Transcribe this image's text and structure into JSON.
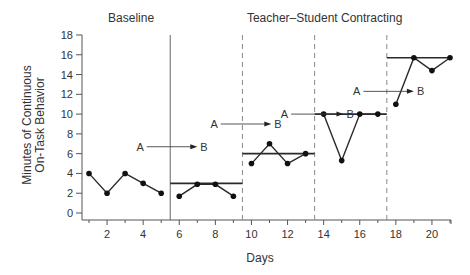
{
  "chart_data": {
    "type": "line",
    "title": "",
    "phase_titles": [
      {
        "label": "Baseline",
        "x_center_day": 3
      },
      {
        "label": "Teacher–Student Contracting",
        "x_center_day": 13.5
      }
    ],
    "xlabel": "Days",
    "ylabel_line1": "Minutes of Continuous",
    "ylabel_line2": "On-Task Behavior",
    "ylim": [
      0,
      18
    ],
    "xlim": [
      0.5,
      21.2
    ],
    "y_ticks": [
      0,
      2,
      4,
      6,
      8,
      10,
      12,
      14,
      16,
      18
    ],
    "x_ticks_labeled": [
      2,
      4,
      6,
      8,
      10,
      12,
      14,
      16,
      18,
      20
    ],
    "x_ticks_minor": [
      1,
      3,
      5,
      7,
      9,
      11,
      13,
      15,
      17,
      19,
      21
    ],
    "grid": false,
    "phase_change_lines": [
      {
        "day": 5.5,
        "style": "solid"
      },
      {
        "day": 9.5,
        "style": "dashed"
      },
      {
        "day": 13.5,
        "style": "dashed"
      },
      {
        "day": 17.5,
        "style": "dashed"
      }
    ],
    "series": [
      {
        "name": "Baseline",
        "x": [
          1,
          2,
          3,
          4,
          5
        ],
        "values": [
          4,
          2,
          4,
          3,
          2
        ]
      },
      {
        "name": "Contract Phase 1",
        "x": [
          6,
          7,
          8,
          9
        ],
        "values": [
          1.7,
          2.9,
          2.9,
          1.7
        ]
      },
      {
        "name": "Contract Phase 2",
        "x": [
          10,
          11,
          12,
          13
        ],
        "values": [
          5,
          7,
          5,
          6
        ]
      },
      {
        "name": "Contract Phase 3",
        "x": [
          14,
          15,
          16,
          17
        ],
        "values": [
          10,
          5.3,
          10,
          10
        ]
      },
      {
        "name": "Contract Phase 4",
        "x": [
          18,
          19,
          20,
          21
        ],
        "values": [
          11,
          15.7,
          14.4,
          15.7
        ]
      }
    ],
    "criterion_lines": [
      {
        "from_day": 5.5,
        "to_day": 9.5,
        "value": 3
      },
      {
        "from_day": 9.5,
        "to_day": 13.5,
        "value": 6
      },
      {
        "from_day": 13.5,
        "to_day": 17.5,
        "value": 10
      },
      {
        "from_day": 17.5,
        "to_day": 21,
        "value": 15.7
      }
    ],
    "annotations": [
      {
        "from": "A",
        "to": "B",
        "x_start_day": 4.2,
        "x_end_day": 7.0,
        "y": 6.7
      },
      {
        "from": "A",
        "to": "B",
        "x_start_day": 8.3,
        "x_end_day": 11.1,
        "y": 9.0
      },
      {
        "from": "A",
        "to": "B",
        "x_start_day": 12.2,
        "x_end_day": 15.1,
        "y": 10.0
      },
      {
        "from": "A",
        "to": "B",
        "x_start_day": 16.2,
        "x_end_day": 19.0,
        "y": 12.3
      }
    ]
  },
  "colors": {
    "ink": "#2a2a2a",
    "axis": "#555555",
    "dash": "#888888"
  }
}
